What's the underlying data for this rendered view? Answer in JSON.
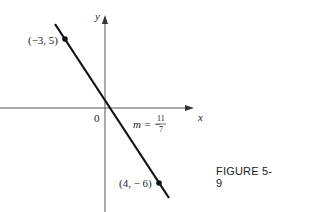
{
  "figure": {
    "caption": "FIGURE 5-9",
    "axes": {
      "x_label": "x",
      "y_label": "y",
      "origin_label": "0"
    },
    "points": [
      {
        "label": "(−3, 5)",
        "x": -3,
        "y": 5
      },
      {
        "label": "(4, − 6)",
        "x": 4,
        "y": -6
      }
    ],
    "slope": {
      "prefix": "m = −",
      "numerator": "11",
      "denominator": "7"
    }
  }
}
